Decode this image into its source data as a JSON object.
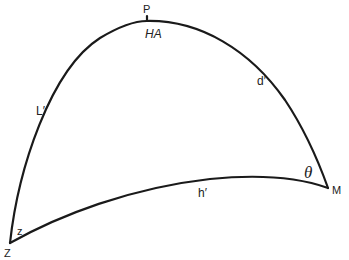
{
  "diagram": {
    "type": "spherical-triangle",
    "stroke_color": "#1a1a1a",
    "background": "#ffffff",
    "vertices": {
      "P": {
        "label": "P",
        "angle_label": "HA"
      },
      "Z": {
        "label": "Z",
        "angle_label": "z"
      },
      "M": {
        "label": "M",
        "angle_label": "θ"
      }
    },
    "sides": {
      "PZ": {
        "label": "L′"
      },
      "PM": {
        "label": "d′"
      },
      "ZM": {
        "label": "h′"
      }
    }
  }
}
